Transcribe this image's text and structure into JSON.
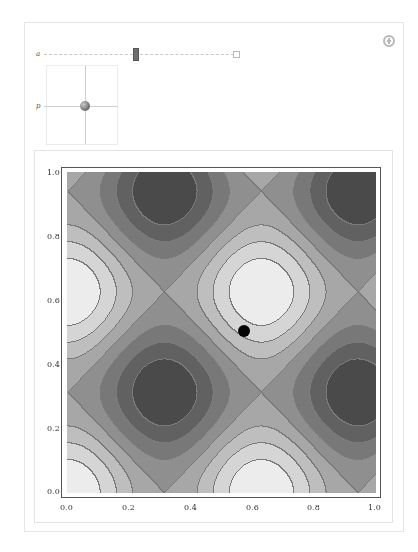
{
  "controls": {
    "add_button_icon": "plus-circle-icon",
    "slider_a": {
      "label": "a",
      "position_fraction": 0.47
    },
    "locator_p": {
      "label": "p"
    }
  },
  "chart_data": {
    "type": "contour",
    "title": "",
    "xlabel": "",
    "ylabel": "",
    "xlim": [
      0.0,
      1.0
    ],
    "ylim": [
      0.0,
      1.0
    ],
    "x_ticks": [
      "0.0",
      "0.2",
      "0.4",
      "0.6",
      "0.8",
      "1.0"
    ],
    "y_ticks": [
      "0.0",
      "0.2",
      "0.4",
      "0.6",
      "0.8",
      "1.0"
    ],
    "function_estimate": "cos(10 x) + cos(10 y)",
    "maxima": [
      [
        0.0,
        0.0
      ],
      [
        0.63,
        0.0
      ],
      [
        0.0,
        0.63
      ],
      [
        0.63,
        0.63
      ]
    ],
    "minima": [
      [
        0.31,
        0.31
      ],
      [
        0.94,
        0.31
      ],
      [
        0.31,
        0.94
      ],
      [
        0.94,
        0.94
      ]
    ],
    "levels": 8,
    "colors": {
      "darkest": "#4a4a4a",
      "lightest": "#ececec",
      "contour_line": "#7a7a7a"
    },
    "point": {
      "x": 0.57,
      "y": 0.5,
      "color": "#050505"
    },
    "grid": false,
    "legend": null
  }
}
